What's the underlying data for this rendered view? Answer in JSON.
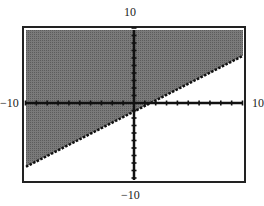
{
  "chart_data": {
    "type": "area",
    "title": "",
    "window": {
      "xmin": -10,
      "xmax": 10,
      "ymin": -10,
      "ymax": 10,
      "xscl": 1,
      "yscl": 1
    },
    "tick_labels": {
      "top": "10",
      "bottom": "−10",
      "left": "−10",
      "right": "10"
    },
    "boundary_line": {
      "style": "dotted",
      "points": [
        {
          "x": -10,
          "y": -8.5
        },
        {
          "x": 0,
          "y": -1.1
        },
        {
          "x": 1.5,
          "y": 0
        },
        {
          "x": 10,
          "y": 6.3
        }
      ]
    },
    "shaded_region": "above",
    "colors": {
      "shade": "#6e6e6e",
      "axes": "#111111",
      "frame": "#222222",
      "background": "#ffffff"
    },
    "grid": false,
    "legend": null
  },
  "labels": {
    "top": "10",
    "bottom": "−10",
    "left": "−10",
    "right": "10"
  }
}
